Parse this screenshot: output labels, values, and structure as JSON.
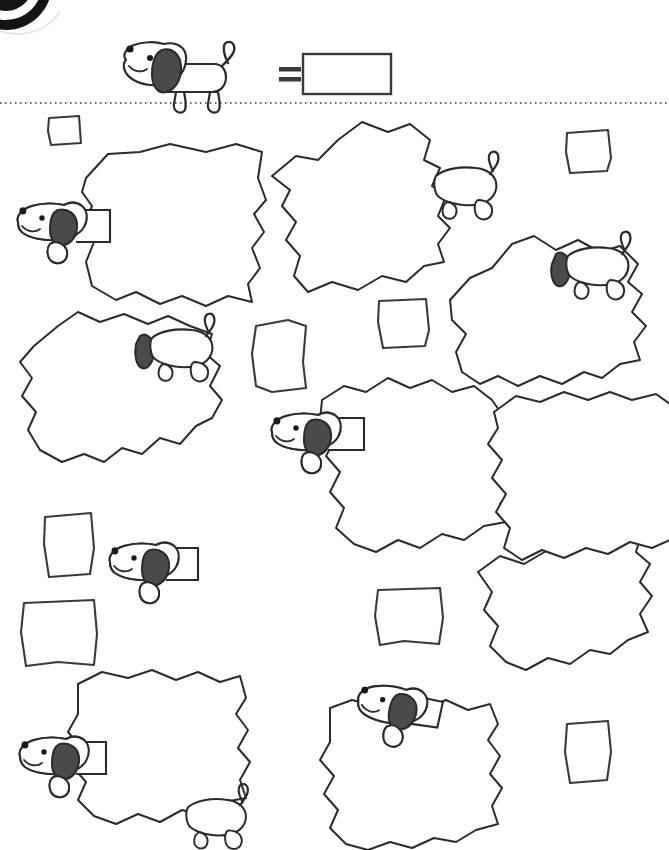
{
  "page": {
    "type": "worksheet",
    "width": 669,
    "height": 850,
    "background_color": "#ffffff",
    "ink_color": "#2b2b2b",
    "ear_fill_color": "#4a4a4a",
    "corner_badge": {
      "name": "corner-badge",
      "description": "partial dark circular badge cut off at top-left corner",
      "color": "#141414",
      "ring_color": "#ffffff"
    }
  },
  "header": {
    "key_icon_label": "dog",
    "equals_sign": "=",
    "answer_box": {
      "label": "answer-box",
      "value": "",
      "placeholder": ""
    }
  },
  "divider": {
    "style": "dotted",
    "y": 103,
    "color": "#3a3a3a"
  },
  "legend": {
    "dog_count": 10,
    "square_count": 9,
    "blob_count": 10
  },
  "squares": [
    {
      "id": "square-1",
      "x": 48,
      "y": 116,
      "w": 32,
      "h": 28
    },
    {
      "id": "square-2",
      "x": 566,
      "y": 131,
      "w": 44,
      "h": 40
    },
    {
      "id": "square-3",
      "x": 378,
      "y": 299,
      "w": 50,
      "h": 48
    },
    {
      "id": "square-4",
      "x": 254,
      "y": 321,
      "w": 53,
      "h": 70
    },
    {
      "id": "square-5",
      "x": 43,
      "y": 514,
      "w": 50,
      "h": 60
    },
    {
      "id": "square-6",
      "x": 22,
      "y": 600,
      "w": 73,
      "h": 66
    },
    {
      "id": "square-7",
      "x": 376,
      "y": 589,
      "w": 64,
      "h": 56
    },
    {
      "id": "square-8",
      "x": 565,
      "y": 723,
      "w": 44,
      "h": 58
    },
    {
      "id": "square-9",
      "x": 0,
      "y": 0,
      "w": 0,
      "h": 0
    }
  ],
  "blobs": [
    {
      "id": "blob-1",
      "dog": "head-left",
      "note": "top-left large jagged blob, dog head at left edge"
    },
    {
      "id": "blob-2",
      "dog": "rear-right",
      "note": "top-center blob, dog rear with tail at right edge"
    },
    {
      "id": "blob-3",
      "dog": "head-right",
      "note": "upper-right blob, dog body at right edge"
    },
    {
      "id": "blob-4",
      "dog": "rear-top",
      "note": "mid-left blob, dog rear at top-right"
    },
    {
      "id": "blob-5",
      "dog": "head-left",
      "note": "center blob, dog head at left edge"
    },
    {
      "id": "blob-6",
      "dog": "none",
      "note": "right-middle jagged blob"
    },
    {
      "id": "blob-7",
      "dog": "head-left",
      "note": "lower-left blob, dog head at left edge, legs bottom"
    },
    {
      "id": "blob-8",
      "dog": "head-top",
      "note": "bottom-center blob, dog head over top edge"
    },
    {
      "id": "blob-9",
      "dog": "none",
      "note": "lower-right blob"
    },
    {
      "id": "blob-10",
      "dog": "none",
      "note": "right edge blob"
    }
  ],
  "dogs": [
    {
      "id": "dog-header",
      "pose": "full-body-side",
      "x": 118,
      "y": 45
    },
    {
      "id": "dog-1",
      "pose": "head-left",
      "x": 14,
      "y": 196
    },
    {
      "id": "dog-2",
      "pose": "rear-right",
      "x": 440,
      "y": 158
    },
    {
      "id": "dog-3",
      "pose": "rear-right",
      "x": 553,
      "y": 238
    },
    {
      "id": "dog-4",
      "pose": "rear-right",
      "x": 135,
      "y": 322
    },
    {
      "id": "dog-5",
      "pose": "head-left",
      "x": 270,
      "y": 405
    },
    {
      "id": "dog-6",
      "pose": "head-left",
      "x": 108,
      "y": 535
    },
    {
      "id": "dog-7",
      "pose": "head-left",
      "x": 18,
      "y": 728
    },
    {
      "id": "dog-8",
      "pose": "head-top",
      "x": 360,
      "y": 673
    },
    {
      "id": "dog-9",
      "pose": "rear-bottom",
      "x": 190,
      "y": 790
    }
  ]
}
